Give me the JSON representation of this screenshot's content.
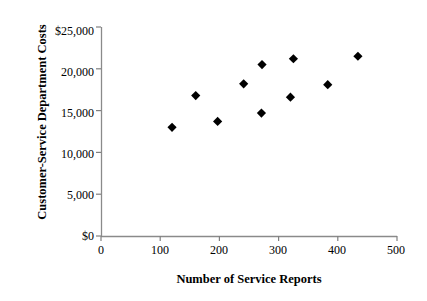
{
  "chart_data": {
    "type": "scatter",
    "title": "",
    "xlabel": "Number of Service Reports",
    "ylabel": "Customer-Service Department Costs",
    "xlim": [
      0,
      500
    ],
    "ylim": [
      0,
      25000
    ],
    "xticks": [
      "0",
      "100",
      "200",
      "300",
      "400",
      "500"
    ],
    "xtick_values": [
      0,
      100,
      200,
      300,
      400,
      500
    ],
    "yticks": [
      "$0",
      "5,000",
      "10,000",
      "15,000",
      "20,000",
      "$25,000"
    ],
    "ytick_values": [
      0,
      5000,
      10000,
      15000,
      20000,
      25000
    ],
    "grid": false,
    "legend": null,
    "marker_style": "filled-diamond",
    "marker_color": "#000000",
    "axis_color": "#808080",
    "points": [
      {
        "x": 120,
        "y": 13000
      },
      {
        "x": 160,
        "y": 16800
      },
      {
        "x": 197,
        "y": 13700
      },
      {
        "x": 241,
        "y": 18200
      },
      {
        "x": 272,
        "y": 20500
      },
      {
        "x": 271,
        "y": 14700
      },
      {
        "x": 320,
        "y": 16600
      },
      {
        "x": 325,
        "y": 21200
      },
      {
        "x": 383,
        "y": 18100
      },
      {
        "x": 434,
        "y": 21500
      }
    ]
  }
}
